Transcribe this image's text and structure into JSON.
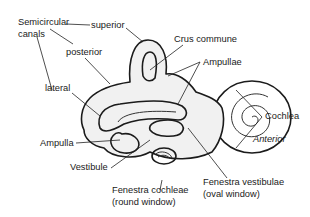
{
  "diagram": {
    "labels": {
      "semicircular_canals_line1": "Semicircular",
      "semicircular_canals_line2": "canals",
      "superior": "superior",
      "posterior": "posterior",
      "lateral": "lateral",
      "crus_commune": "Crus commune",
      "ampullae": "Ampullae",
      "cochlea": "Cochlea",
      "anterior": "Anterior",
      "ampulla": "Ampulla",
      "vestibule": "Vestibule",
      "fenestra_cochleae_line1": "Fenestra cochleae",
      "fenestra_cochleae_line2": "(round window)",
      "fenestra_vestibulae_line1": "Fenestra vestibulae",
      "fenestra_vestibulae_line2": "(oval window)"
    },
    "colors": {
      "outline": "#1b1b1b",
      "stipple_fill": "#f1f1f1",
      "text": "#1a1a1a",
      "background": "#ffffff"
    }
  }
}
